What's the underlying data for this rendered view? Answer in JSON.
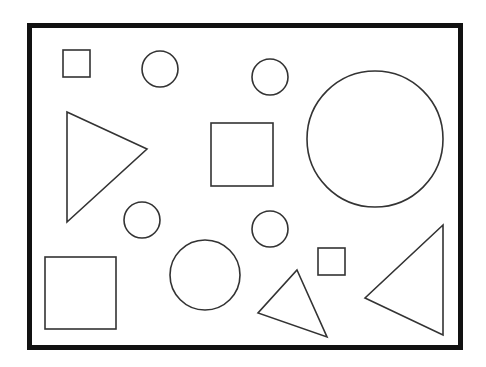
{
  "canvas": {
    "width": 486,
    "height": 367,
    "background": "#ffffff"
  },
  "frame": {
    "x": 29.5,
    "y": 25.5,
    "width": 431,
    "height": 322,
    "stroke": "#111111",
    "stroke_width": 5
  },
  "shape_style": {
    "stroke": "#333333",
    "stroke_width": 1.6,
    "fill": "none"
  },
  "shapes": {
    "squares": [
      {
        "name": "small-square-top-left",
        "x": 63,
        "y": 50,
        "w": 27,
        "h": 27
      },
      {
        "name": "medium-square-center",
        "x": 211,
        "y": 123,
        "w": 62,
        "h": 63
      },
      {
        "name": "large-square-bottom-left",
        "x": 45,
        "y": 257,
        "w": 71,
        "h": 72
      },
      {
        "name": "small-square-bottom-right",
        "x": 318,
        "y": 248,
        "w": 27,
        "h": 27
      }
    ],
    "circles": [
      {
        "name": "circle-top-left",
        "cx": 160,
        "cy": 69,
        "r": 18
      },
      {
        "name": "circle-top-center",
        "cx": 270,
        "cy": 77,
        "r": 18
      },
      {
        "name": "large-circle-right",
        "cx": 375,
        "cy": 139,
        "r": 68
      },
      {
        "name": "circle-middle-left",
        "cx": 142,
        "cy": 220,
        "r": 18
      },
      {
        "name": "circle-middle-right",
        "cx": 270,
        "cy": 229,
        "r": 18
      },
      {
        "name": "circle-bottom-center",
        "cx": 205,
        "cy": 275,
        "r": 35
      }
    ],
    "triangles": [
      {
        "name": "triangle-left",
        "points": "67,112 147,149 67,222"
      },
      {
        "name": "triangle-bottom-center",
        "points": "297,270 327,337 258,313"
      },
      {
        "name": "triangle-bottom-right",
        "points": "443,225 443,335 365,298"
      }
    ]
  }
}
